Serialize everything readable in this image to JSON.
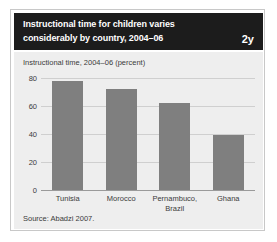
{
  "header": {
    "title": "Instructional time for children varies considerably by country, 2004–06",
    "figure_number": "2y",
    "background_color": "#1c1c1c",
    "text_color": "#ffffff"
  },
  "source": {
    "text": "Source: Abadzi 2007."
  },
  "panel": {
    "background_color": "#eeeeee",
    "gridline_color": "#cfcfcf",
    "axis_color": "#9a9a9a"
  },
  "chart_data": {
    "type": "bar",
    "title": "Instructional time, 2004–06 (percent)",
    "subtitle": "",
    "xlabel": "",
    "ylabel": "",
    "categories": [
      "Tunisia",
      "Morocco",
      "Pernambuco,\nBrazil",
      "Ghana"
    ],
    "values": [
      78,
      72,
      62,
      39
    ],
    "ylim": [
      0,
      80
    ],
    "yticks": [
      0,
      20,
      40,
      60,
      80
    ],
    "ytick_labels": [
      "0",
      "20",
      "40",
      "60",
      "80"
    ],
    "grid": true,
    "legend": false,
    "bar_color": "#7f7f7f",
    "series": [
      {
        "name": "Instructional time (percent)",
        "values": [
          78,
          72,
          62,
          39
        ]
      }
    ]
  }
}
